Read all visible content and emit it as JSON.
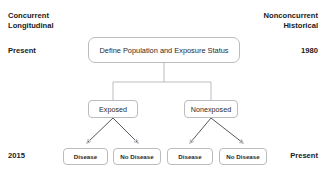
{
  "diagram": {
    "colors": {
      "background": "#ffffff",
      "box_border": "#b9bcc0",
      "text": "#2a2a2a",
      "label_text": "#1a1a1a",
      "arrow": "#555a60"
    },
    "left_axis": {
      "heading_line1": "Concurrent",
      "heading_line2": "Longitudinal",
      "middle_label": "Present",
      "bottom_label": "2015"
    },
    "right_axis": {
      "heading_line1": "Nonconcurrent",
      "heading_line2": "Historical",
      "middle_label": "1980",
      "bottom_label": "Present"
    },
    "nodes": {
      "root": "Define Population and Exposure Status",
      "exposed": "Exposed",
      "nonexposed": "Nonexposed",
      "exposed_disease": "Disease",
      "exposed_no_disease": "No Disease",
      "nonexposed_disease": "Disease",
      "nonexposed_no_disease": "No Disease"
    }
  }
}
